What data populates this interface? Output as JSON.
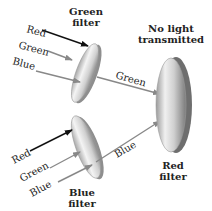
{
  "colors": {
    "red_ray": "#111111",
    "green_ray": "#8a8a8a",
    "blue_ray": "#7a7a7a",
    "filter_light": "#f2f2f2",
    "filter_dark": "#9a9a9a"
  },
  "green_filter": {
    "label_line1": "Green",
    "label_line2": "filter",
    "inputs": [
      "Red",
      "Green",
      "Blue"
    ],
    "output": "Green"
  },
  "blue_filter": {
    "label_line1": "Blue",
    "label_line2": "filter",
    "inputs": [
      "Red",
      "Green",
      "Blue"
    ],
    "output": "Blue"
  },
  "red_filter": {
    "label_line1": "Red",
    "label_line2": "filter",
    "result_line1": "No light",
    "result_line2": "transmitted"
  }
}
